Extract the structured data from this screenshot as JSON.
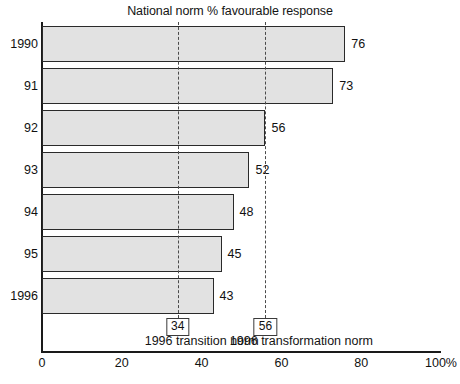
{
  "chart_data": {
    "type": "bar",
    "orientation": "horizontal",
    "title": "National norm % favourable response",
    "xlabel": "",
    "ylabel": "",
    "categories": [
      "1990",
      "91",
      "92",
      "93",
      "94",
      "95",
      "1996"
    ],
    "values": [
      76,
      73,
      56,
      52,
      48,
      45,
      43
    ],
    "value_labels": [
      "76",
      "73",
      "56",
      "52",
      "48",
      "45",
      "43"
    ],
    "xlim": [
      0,
      100
    ],
    "xticks": [
      0,
      20,
      40,
      60,
      80,
      100
    ],
    "xtick_labels": [
      "0",
      "20",
      "40",
      "60",
      "80",
      "100%"
    ],
    "grid": false,
    "legend": "none",
    "bar_fill_color": "#e2e2e2",
    "bar_edge_color": "#2a2a2a",
    "axis_color": "#1a1a1a",
    "reference_lines": [
      {
        "value": 34,
        "box_label": "34",
        "caption": "1996 transition norm",
        "style": "dashed",
        "color": "#4a4a4a"
      },
      {
        "value": 56,
        "box_label": "56",
        "caption": "1996 transformation norm",
        "style": "dashed",
        "color": "#4a4a4a"
      }
    ]
  }
}
